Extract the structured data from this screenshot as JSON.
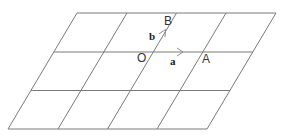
{
  "diagram": {
    "type": "parallelogram-grid",
    "columns": 4,
    "rows": 3,
    "labels": {
      "origin": "O",
      "point_a": "A",
      "point_b": "B",
      "vector_a": "a",
      "vector_b": "b"
    },
    "colors": {
      "line": "#7a7a7a",
      "text": "#333333",
      "background": "#ffffff"
    }
  }
}
